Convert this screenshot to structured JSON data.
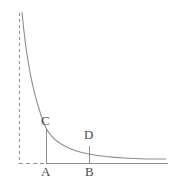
{
  "figure": {
    "type": "geometry-diagram",
    "background_color": "#ffffff",
    "stroke_color": "#8d8d8d",
    "label_color": "#4a4a4a",
    "stroke_width": 1,
    "labels": {
      "C": "C",
      "D": "D",
      "A": "A",
      "B": "B"
    },
    "points": {
      "C": {
        "x": 46,
        "y": 128
      },
      "D": {
        "x": 89,
        "y": 146
      },
      "A": {
        "x": 46,
        "y": 163
      },
      "B": {
        "x": 89,
        "y": 163
      }
    },
    "asymptote": {
      "orientation": "vertical",
      "style": "dashed",
      "x": 19,
      "y_start": 13,
      "y_end": 163
    },
    "baseline": {
      "orientation": "horizontal",
      "y": 163,
      "dashed_from_x": 19,
      "dashed_to_x": 46,
      "solid_from_x": 46,
      "solid_to_x": 168
    },
    "curve": {
      "kind": "hyperbola",
      "start": {
        "x": 22,
        "y": 12
      },
      "end": {
        "x": 166,
        "y": 155
      }
    }
  }
}
